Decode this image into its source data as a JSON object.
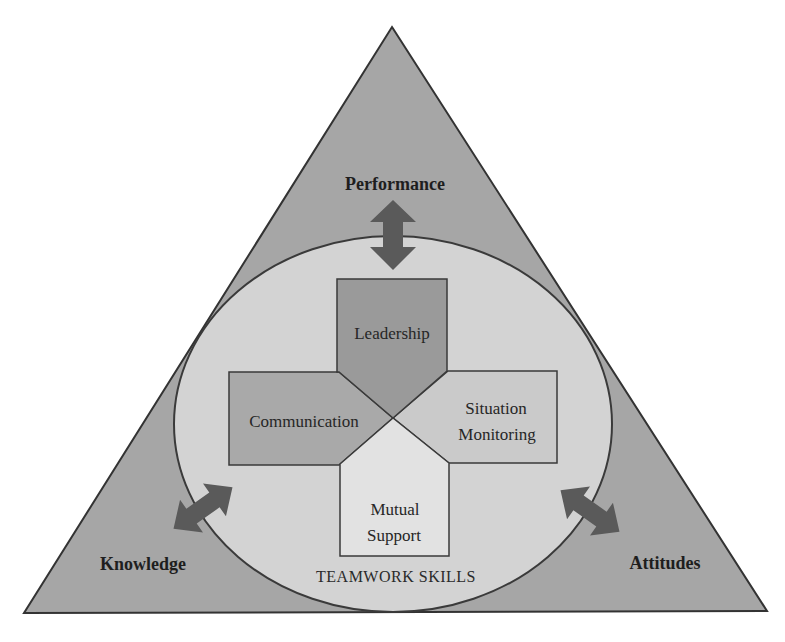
{
  "diagram": {
    "colors": {
      "background": "#ffffff",
      "triangle_fill": "#a6a6a6",
      "triangle_stroke": "#333333",
      "ellipse_fill": "#d3d3d3",
      "ellipse_stroke": "#3a3a3a",
      "arrow_fill": "#5a5a5a",
      "leadership_fill": "#9a9a9a",
      "communication_fill": "#a9a9a9",
      "situation_monitoring_fill": "#cacaca",
      "mutual_support_fill": "#e2e2e2",
      "box_stroke": "#3a3a3a"
    },
    "outer_outcomes": [
      {
        "id": "performance",
        "label": "Performance",
        "position": "top"
      },
      {
        "id": "knowledge",
        "label": "Knowledge",
        "position": "bottom-left"
      },
      {
        "id": "attitudes",
        "label": "Attitudes",
        "position": "bottom-right"
      }
    ],
    "center": {
      "title": "TEAMWORK SKILLS"
    },
    "skills": [
      {
        "id": "leadership",
        "lines": [
          "Leadership"
        ],
        "position": "top"
      },
      {
        "id": "communication",
        "lines": [
          "Communication"
        ],
        "position": "left"
      },
      {
        "id": "situation-monitoring",
        "lines": [
          "Situation",
          "Monitoring"
        ],
        "position": "right"
      },
      {
        "id": "mutual-support",
        "lines": [
          "Mutual",
          "Support"
        ],
        "position": "bottom"
      }
    ],
    "arrows": [
      {
        "id": "performance-arrow",
        "type": "bidirectional",
        "connects": [
          "Performance",
          "TEAMWORK SKILLS"
        ]
      },
      {
        "id": "knowledge-arrow",
        "type": "bidirectional",
        "connects": [
          "Knowledge",
          "TEAMWORK SKILLS"
        ]
      },
      {
        "id": "attitudes-arrow",
        "type": "bidirectional",
        "connects": [
          "Attitudes",
          "TEAMWORK SKILLS"
        ]
      }
    ]
  }
}
